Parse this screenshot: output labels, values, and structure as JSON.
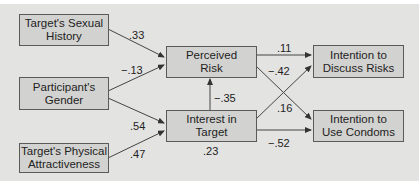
{
  "diagram": {
    "type": "path-model",
    "nodes": {
      "sexual_history": "Target's Sexual\nHistory",
      "gender": "Participant's\nGender",
      "physical_attractiveness": "Target's Physical\nAttractiveness",
      "perceived_risk": "Perceived\nRisk",
      "interest": "Interest in\nTarget",
      "discuss_risks": "Intention to\nDiscuss Risks",
      "use_condoms": "Intention to\nUse Condoms"
    },
    "edges": [
      {
        "from": "sexual_history",
        "to": "perceived_risk",
        "label": ".33"
      },
      {
        "from": "gender",
        "to": "perceived_risk",
        "label": "−.13"
      },
      {
        "from": "gender",
        "to": "interest",
        "label": ".54"
      },
      {
        "from": "physical_attractiveness",
        "to": "interest",
        "label": ".47"
      },
      {
        "from": "interest",
        "to": "perceived_risk",
        "label": "−.35"
      },
      {
        "from": "perceived_risk",
        "to": "discuss_risks",
        "label": ".11"
      },
      {
        "from": "perceived_risk",
        "to": "use_condoms",
        "label": "−.42"
      },
      {
        "from": "interest",
        "to": "discuss_risks",
        "label": ".16"
      },
      {
        "from": "interest",
        "to": "use_condoms",
        "label": "−.52"
      }
    ],
    "interest_r2": ".23"
  }
}
